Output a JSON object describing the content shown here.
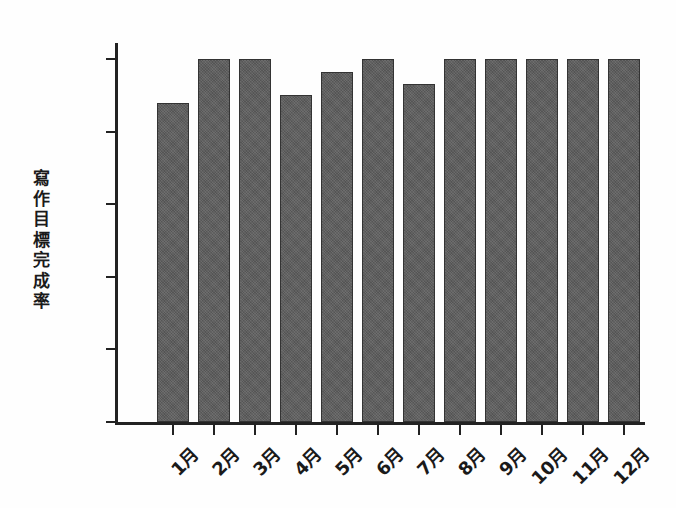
{
  "chart_data": {
    "type": "bar",
    "title": "",
    "subtitle": "",
    "xlabel": "",
    "ylabel": "寫作目標完成率",
    "categories": [
      "1月",
      "2月",
      "3月",
      "4月",
      "5月",
      "6月",
      "7月",
      "8月",
      "9月",
      "10月",
      "11月",
      "12月"
    ],
    "values": [
      88,
      100,
      100,
      90,
      96.5,
      100,
      93,
      100,
      100,
      100,
      100,
      100
    ],
    "ylim": [
      0,
      100
    ],
    "y_ticks": [
      0,
      20,
      40,
      60,
      80,
      100
    ],
    "y_tick_labels": [
      "0",
      "20%",
      "40%",
      "60%",
      "80%",
      "100%"
    ],
    "grid": false,
    "legend": "none",
    "bar_color": "#5d5d5d",
    "bar_edge_color": "#333333",
    "axis_color": "#222222",
    "background_color": "#ffffff",
    "x_tick_label_rotation": -45
  },
  "axis": {
    "y_title_chars": [
      "寫",
      "作",
      "目",
      "標",
      "完",
      "成",
      "率"
    ]
  }
}
